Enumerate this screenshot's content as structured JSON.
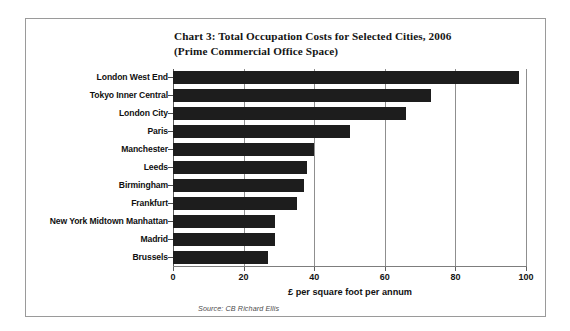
{
  "chart_data": {
    "type": "bar",
    "orientation": "horizontal",
    "title": "Chart 3: Total Occupation Costs for Selected Cities, 2006 (Prime Commercial Office Space)",
    "title_line1": "Chart 3: Total Occupation Costs for Selected Cities, 2006",
    "title_line2": "(Prime Commercial Office Space)",
    "categories": [
      "London West End",
      "Tokyo Inner Central",
      "London City",
      "Paris",
      "Manchester",
      "Leeds",
      "Birmingham",
      "Frankfurt",
      "New York Midtown Manhattan",
      "Madrid",
      "Brussels"
    ],
    "values": [
      98,
      73,
      66,
      50,
      40,
      38,
      37,
      35,
      29,
      29,
      27
    ],
    "xlabel": "£ per square foot per annum",
    "ylabel": "",
    "xlim": [
      0,
      100
    ],
    "xticks": [
      0,
      20,
      40,
      60,
      80,
      100
    ],
    "xtick_labels": [
      "0",
      "20",
      "40",
      "60",
      "80",
      "100"
    ],
    "grid": true,
    "grid_axis": "x",
    "legend": false,
    "bar_color": "#1d1d1d",
    "source": "Source: CB Richard Ellis"
  }
}
